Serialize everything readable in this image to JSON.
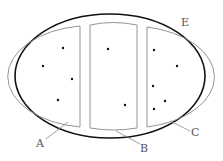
{
  "diagram": {
    "labels": {
      "E": "E",
      "A": "A",
      "B": "B",
      "C": "C"
    },
    "colors": {
      "outer_stroke": "#111111",
      "inner_stroke": "#888888",
      "dot": "#111111",
      "label": "#555555"
    },
    "regions": [
      {
        "id": "A",
        "dots": [
          [
            63,
            48
          ],
          [
            43,
            66
          ],
          [
            72,
            79
          ],
          [
            58,
            100
          ]
        ]
      },
      {
        "id": "B",
        "dots": [
          [
            108,
            49
          ],
          [
            125,
            105
          ]
        ]
      },
      {
        "id": "C",
        "dots": [
          [
            154,
            50
          ],
          [
            177,
            66
          ],
          [
            153,
            86
          ],
          [
            165,
            101
          ],
          [
            154,
            109
          ]
        ]
      }
    ]
  }
}
